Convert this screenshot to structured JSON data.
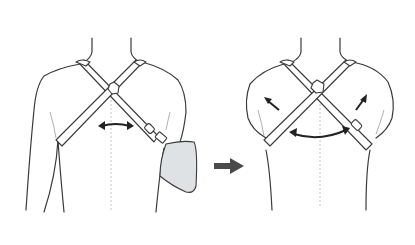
{
  "figure": {
    "description": "Figure-of-eight clavicle brace: before and after tightening",
    "panels": [
      {
        "id": "before",
        "label": "Brace fitted with arm sling"
      },
      {
        "id": "after",
        "label": "Brace tightened, shoulders pulled back"
      }
    ],
    "transition_arrow": "right-arrow"
  },
  "colors": {
    "outline": "#3a3a3a",
    "strap_fill": "#ffffff",
    "sling_fill": "#dfe2e4",
    "arrow": "#4a4a4a",
    "midline": "#b5b5b5"
  }
}
